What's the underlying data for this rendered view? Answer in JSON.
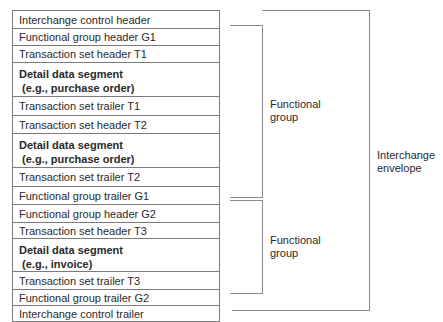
{
  "rows": [
    {
      "label": "Interchange control header",
      "bold": false,
      "h": 18
    },
    {
      "label": "Functional group header G1",
      "bold": false,
      "h": 17
    },
    {
      "label": "Transaction set header T1",
      "bold": false,
      "h": 17
    },
    {
      "label": "Detail data segment\n (e.g., purchase order)",
      "bold": true,
      "h": 34
    },
    {
      "label": "Transaction set trailer T1",
      "bold": false,
      "h": 19
    },
    {
      "label": "Transaction set header T2",
      "bold": false,
      "h": 18
    },
    {
      "label": "Detail data segment\n (e.g., purchase order)",
      "bold": true,
      "h": 34
    },
    {
      "label": "Transaction set trailer T2",
      "bold": false,
      "h": 19
    },
    {
      "label": "Functional group trailer G1",
      "bold": false,
      "h": 18
    },
    {
      "label": "Functional group header G2",
      "bold": false,
      "h": 18
    },
    {
      "label": "Transaction set header T3",
      "bold": false,
      "h": 16
    },
    {
      "label": "Detail data segment\n (e.g., invoice)",
      "bold": true,
      "h": 33
    },
    {
      "label": "Transaction set trailer T3",
      "bold": false,
      "h": 18
    },
    {
      "label": "Functional group trailer G2",
      "bold": false,
      "h": 16
    },
    {
      "label": "Interchange control trailer",
      "bold": false,
      "h": 16
    }
  ],
  "brackets": {
    "group1_label": "Functional\ngroup",
    "group2_label": "Functional\ngroup",
    "envelope_label": "Interchange\nenvelope"
  }
}
